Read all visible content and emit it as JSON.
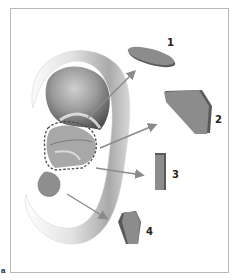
{
  "figure": {
    "panel_letter": "a",
    "colors": {
      "graft_fill": "#8c8c8c",
      "graft_edge": "#5a5a5a",
      "arrow": "#8a8a8a",
      "dashed_outline": "#4a4a4a",
      "frame": "#b8b8b8"
    },
    "grafts": [
      {
        "label": "1",
        "shape": "oval disc",
        "source": "cymba/upper concha"
      },
      {
        "label": "2",
        "shape": "trapezoid plate",
        "source": "concha cavum"
      },
      {
        "label": "3",
        "shape": "narrow strip",
        "source": "lower concha"
      },
      {
        "label": "4",
        "shape": "small pentagon",
        "source": "lobule region"
      }
    ]
  }
}
